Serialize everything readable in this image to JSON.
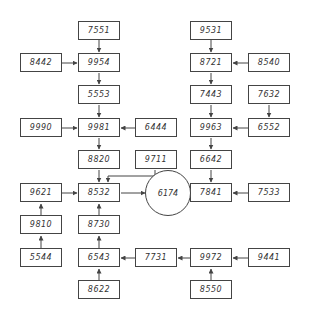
{
  "diagram": {
    "type": "block-flow",
    "nodes": {
      "n7551": "7551",
      "n8442": "8442",
      "n9954": "9954",
      "n5553": "5553",
      "n9990": "9990",
      "n9981": "9981",
      "n6444": "6444",
      "n8820": "8820",
      "n9711": "9711",
      "n9621": "9621",
      "n8532": "8532",
      "n9810": "9810",
      "n8730": "8730",
      "n5544": "5544",
      "n6543": "6543",
      "n8622": "8622",
      "n9531": "9531",
      "n8721": "8721",
      "n8540": "8540",
      "n7443": "7443",
      "n7632": "7632",
      "n9963": "9963",
      "n6552": "6552",
      "n6642": "6642",
      "n7841": "7841",
      "n7533": "7533",
      "n6174": "6174",
      "n7731": "7731",
      "n9972": "9972",
      "n9441": "9441",
      "n8550": "8550"
    },
    "edges": [
      [
        "7551",
        "9954"
      ],
      [
        "8442",
        "9954"
      ],
      [
        "9954",
        "5553"
      ],
      [
        "5553",
        "9981"
      ],
      [
        "9990",
        "9981"
      ],
      [
        "6444",
        "9981"
      ],
      [
        "9981",
        "8820"
      ],
      [
        "8820",
        "8532"
      ],
      [
        "9711",
        "8532"
      ],
      [
        "9621",
        "8532"
      ],
      [
        "8532",
        "6174"
      ],
      [
        "9810",
        "9621"
      ],
      [
        "5544",
        "9810"
      ],
      [
        "8730",
        "8532"
      ],
      [
        "6543",
        "8730"
      ],
      [
        "8622",
        "6543"
      ],
      [
        "7731",
        "6543"
      ],
      [
        "9531",
        "8721"
      ],
      [
        "8540",
        "8721"
      ],
      [
        "8721",
        "7443"
      ],
      [
        "7443",
        "9963"
      ],
      [
        "7632",
        "6552"
      ],
      [
        "6552",
        "9963"
      ],
      [
        "9963",
        "6642"
      ],
      [
        "6642",
        "7841"
      ],
      [
        "7533",
        "7841"
      ],
      [
        "7841",
        "6174"
      ],
      [
        "9972",
        "7731"
      ],
      [
        "9441",
        "9972"
      ],
      [
        "8550",
        "9972"
      ]
    ]
  }
}
